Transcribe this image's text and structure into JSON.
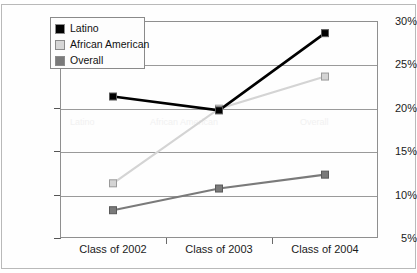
{
  "chart_data": {
    "type": "line",
    "title": "",
    "subtitle": "",
    "xlabel": "",
    "ylabel": "",
    "categories": [
      "Class of 2002",
      "Class of 2003",
      "Class of 2004"
    ],
    "series": [
      {
        "name": "Latino",
        "values": [
          21.3,
          19.7,
          28.6
        ],
        "color": "#000000"
      },
      {
        "name": "African American",
        "values": [
          11.3,
          19.9,
          23.6
        ],
        "color": "#d4d4d4"
      },
      {
        "name": "Overall",
        "values": [
          8.2,
          10.7,
          12.3
        ],
        "color": "#7a7a7a"
      }
    ],
    "ylim": [
      5,
      30
    ],
    "yticks": [
      5,
      10,
      15,
      20,
      25,
      30
    ],
    "ytick_labels": [
      "5%",
      "10%",
      "15%",
      "20%",
      "25%",
      "30%"
    ],
    "grid": true,
    "grid_axis": "y",
    "legend_position": "top-left",
    "marker": "square"
  },
  "legend": {
    "items": [
      {
        "label": "Latino",
        "color": "#000000"
      },
      {
        "label": "African American",
        "color": "#d4d4d4"
      },
      {
        "label": "Overall",
        "color": "#7a7a7a"
      }
    ]
  },
  "axes": {
    "y": {
      "labels": [
        "30%",
        "25%",
        "20%",
        "15%",
        "10%",
        "5%"
      ]
    },
    "x": {
      "labels": [
        "Class of 2002",
        "Class of 2003",
        "Class of 2004"
      ]
    }
  },
  "colors": {
    "latino": "#000000",
    "african_american": "#d4d4d4",
    "overall": "#7a7a7a",
    "grid": "#9a9a9a",
    "frame": "#8f8f8f",
    "background": "#ffffff"
  }
}
